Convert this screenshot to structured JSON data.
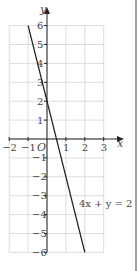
{
  "chart_data": {
    "type": "line",
    "title": "",
    "xlabel": "x",
    "ylabel": "y",
    "xlim": [
      -2,
      3
    ],
    "ylim": [
      -6,
      6
    ],
    "grid": true,
    "x_ticks": [
      -2,
      -1,
      1,
      2,
      3
    ],
    "y_ticks": [
      -6,
      -5,
      -4,
      -3,
      -2,
      -1,
      1,
      2,
      3,
      4,
      5,
      6
    ],
    "origin_label": "O",
    "series": [
      {
        "name": "4x + y = 2",
        "equation": "4x + y = 2",
        "x": [
          -1,
          2
        ],
        "y": [
          6,
          -6
        ]
      }
    ],
    "annotations": [
      {
        "text": "4x + y = 2",
        "x": 1.7,
        "y": -3.4
      }
    ]
  },
  "labels": {
    "x_axis": "x",
    "y_axis": "y",
    "origin": "O",
    "equation": "4x + y = 2"
  }
}
